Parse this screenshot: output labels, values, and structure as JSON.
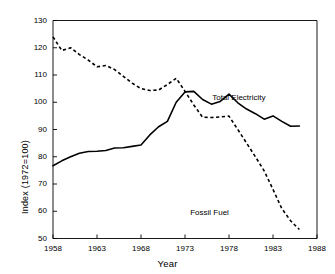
{
  "chart_data": {
    "type": "line",
    "title": "",
    "xlabel": "Year",
    "ylabel": "Index (1972=100)",
    "xlim": [
      1958,
      1988
    ],
    "ylim": [
      50,
      130
    ],
    "xticks": [
      1958,
      1963,
      1968,
      1973,
      1978,
      1983,
      1988
    ],
    "yticks": [
      50,
      60,
      70,
      80,
      90,
      100,
      110,
      120,
      130
    ],
    "grid": false,
    "legend_position": "inline-annotations",
    "x": [
      1958,
      1959,
      1960,
      1961,
      1962,
      1963,
      1964,
      1965,
      1966,
      1967,
      1968,
      1969,
      1970,
      1971,
      1972,
      1973,
      1974,
      1975,
      1976,
      1977,
      1978,
      1979,
      1980,
      1981,
      1982,
      1983,
      1984,
      1985,
      1986
    ],
    "series": [
      {
        "name": "Total Electricity",
        "style": "solid",
        "color": "#000000",
        "label_x": 1979.5,
        "label_y": 101.5,
        "values": [
          76.7,
          78.5,
          80.0,
          81.3,
          81.9,
          82.0,
          82.3,
          83.2,
          83.3,
          83.8,
          84.3,
          88.0,
          91.0,
          93.0,
          100.0,
          103.8,
          104.0,
          101.0,
          99.3,
          100.3,
          103.0,
          99.8,
          97.5,
          95.8,
          93.8,
          95.0,
          93.0,
          91.2,
          91.3
        ]
      },
      {
        "name": "Fossil Fuel",
        "style": "dashed",
        "color": "#000000",
        "label_x": 1977.0,
        "label_y": 59.5,
        "values": [
          124.0,
          119.0,
          120.0,
          117.5,
          115.5,
          113.0,
          113.5,
          112.0,
          109.5,
          107.0,
          105.0,
          104.3,
          104.5,
          106.5,
          108.8,
          104.0,
          99.0,
          94.5,
          94.4,
          94.6,
          94.9,
          90.0,
          85.0,
          80.0,
          74.8,
          68.0,
          61.0,
          56.5,
          53.3
        ]
      }
    ],
    "annotations": [
      {
        "text": "Total Electricity",
        "x": 1979.5,
        "y": 101.5
      },
      {
        "text": "Fossil Fuel",
        "x": 1977.0,
        "y": 59.5
      }
    ]
  },
  "axes": {
    "xlabel": "Year",
    "ylabel": "Index (1972=100)",
    "xtick_labels": [
      "1958",
      "1963",
      "1968",
      "1973",
      "1978",
      "1983",
      "1988"
    ],
    "ytick_labels": [
      "50",
      "60",
      "70",
      "80",
      "90",
      "100",
      "110",
      "120",
      "130"
    ]
  }
}
